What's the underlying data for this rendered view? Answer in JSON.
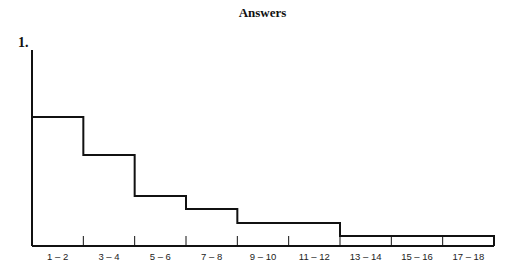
{
  "header": {
    "title": "Answers"
  },
  "question": {
    "number": "1."
  },
  "chart_data": {
    "type": "bar",
    "subtype": "histogram-step",
    "title": "",
    "xlabel": "",
    "ylabel": "",
    "categories": [
      "1 – 2",
      "3 – 4",
      "5 – 6",
      "7 – 8",
      "9 – 10",
      "11 – 12",
      "13 – 14",
      "15 – 16",
      "17 – 18"
    ],
    "values": [
      129,
      91,
      50,
      37,
      23,
      23,
      10,
      10,
      10
    ],
    "values_note": "relative heights (no y-axis scale shown); bins 9–12 share one level and bins 13–18 share one level",
    "y_axis_ticks": false,
    "grid": false,
    "legend": null
  }
}
